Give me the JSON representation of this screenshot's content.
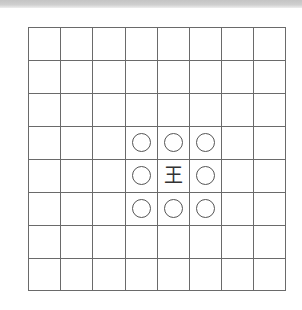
{
  "diagram": {
    "type": "shogi-move-diagram",
    "board": {
      "rows": 8,
      "cols": 8,
      "line_color": "#6a6a6a"
    },
    "piece": {
      "label": "王",
      "name": "king",
      "row": 4,
      "col": 4
    },
    "moves": [
      {
        "row": 3,
        "col": 3,
        "marker": "circle"
      },
      {
        "row": 3,
        "col": 4,
        "marker": "circle"
      },
      {
        "row": 3,
        "col": 5,
        "marker": "circle"
      },
      {
        "row": 4,
        "col": 3,
        "marker": "circle"
      },
      {
        "row": 4,
        "col": 5,
        "marker": "circle"
      },
      {
        "row": 5,
        "col": 3,
        "marker": "circle"
      },
      {
        "row": 5,
        "col": 4,
        "marker": "circle"
      },
      {
        "row": 5,
        "col": 5,
        "marker": "circle"
      }
    ]
  }
}
